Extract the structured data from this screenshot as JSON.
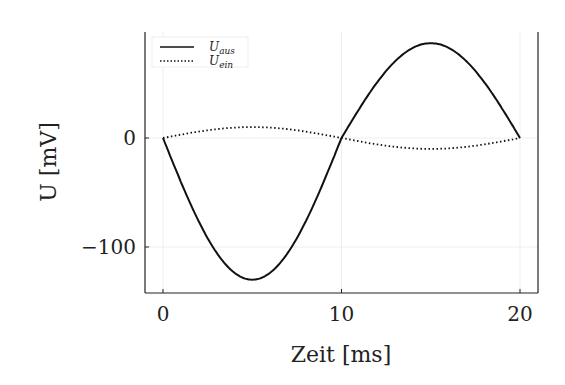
{
  "chart_data": {
    "type": "line",
    "title": "",
    "xlabel": "Zeit [ms]",
    "ylabel": "U [mV]",
    "xlim": [
      -1,
      21
    ],
    "ylim": [
      -143,
      97
    ],
    "x_ticks": [
      "0",
      "10",
      "20"
    ],
    "y_ticks": [
      "0",
      "−100"
    ],
    "grid": true,
    "legend_position": "upper left",
    "series": [
      {
        "name": "U_aus",
        "label_main": "U",
        "label_sub": "aus",
        "style": "solid",
        "amplitude": -130,
        "peak_positive": 87,
        "peak_negative": -130,
        "x": [
          0,
          2.5,
          5,
          7.5,
          10,
          12.5,
          15,
          17.5,
          20
        ],
        "values": [
          0,
          -92,
          -130,
          -92,
          0,
          62,
          87,
          62,
          0
        ]
      },
      {
        "name": "U_ein",
        "label_main": "U",
        "label_sub": "ein",
        "style": "dotted",
        "amplitude": 10,
        "x": [
          0,
          2.5,
          5,
          7.5,
          10,
          12.5,
          15,
          17.5,
          20
        ],
        "values": [
          0,
          7,
          10,
          7,
          0,
          -7,
          -10,
          -7,
          0
        ]
      }
    ]
  }
}
